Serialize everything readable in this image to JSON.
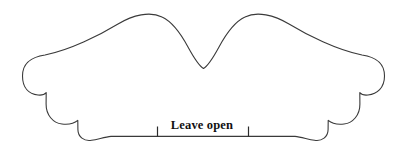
{
  "figure": {
    "shape_name": "butterfly-pattern-outline",
    "background_color": "#ffffff",
    "outline_color": "#3a3a3a",
    "fill_color": "#ffffff",
    "stroke_width_px": 1.1,
    "width_px": 404,
    "height_px": 168
  },
  "annotations": {
    "leave_open_label": "Leave open",
    "label_color": "#111111",
    "label_font_weight": "bold",
    "label_font_style": "serif",
    "tick_color": "#2b2b2b"
  },
  "geometry": {
    "outline_d": "M 22.5 76 C 22.5 62 32 57 45 55 C 70 50 100 35 118 24 C 133 15 150 11 162 17 C 173 22 181 34 188 47 C 194 58 199 66 203.5 68.5 C 208 66 213 58 219 47 C 226 34 234 22 245 17 C 257 11 274 15 289 24 C 307 35 337 50 362 55 C 375 57 384.5 62 384.5 76 C 384.5 88 377 94 368 95 C 364.5 95.4 361.5 94.6 359.8 92.6 L 359.8 92.6 L 359.9 104 C 360 115 353 123 344 124 C 337 124.8 331.5 123.2 328.2 120.4 L 328.2 120.4 L 328.1 129.5 C 328 137 322 141.5 314.5 140.3 C 308 139.3 301 137 295 136.4 L 248.5 136.4 L 157.5 136.4 L 111 136.4 C 105 137 98 139.3 91.5 140.3 C 84 141.5 78 137 77.9 129.5 L 77.8 120.4 L 77.8 120.4 C 74.5 123.2 69 124.8 62 124 C 53 123 46 115 46.1 104 L 46.2 92.6 L 46.2 92.6 C 44.5 94.6 41.5 95.4 38 95 C 29 94 22.5 88 22.5 76 Z",
    "baseline_y": 136.4,
    "tick_left_x": 157.5,
    "tick_right_x": 248.5,
    "tick_top_y": 126.5,
    "tick_bottom_y": 136.4
  }
}
